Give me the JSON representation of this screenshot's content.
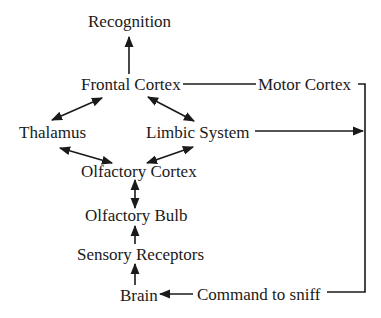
{
  "diagram": {
    "title": "",
    "nodes": [
      {
        "id": "recognition",
        "label": "Recognition"
      },
      {
        "id": "frontal_cortex",
        "label": "Frontal Cortex"
      },
      {
        "id": "motor_cortex",
        "label": "Motor Cortex"
      },
      {
        "id": "thalamus",
        "label": "Thalamus"
      },
      {
        "id": "limbic_system",
        "label": "Limbic System"
      },
      {
        "id": "olfactory_cortex",
        "label": "Olfactory Cortex"
      },
      {
        "id": "olfactory_bulb",
        "label": "Olfactory Bulb"
      },
      {
        "id": "sensory_receptors",
        "label": "Sensory Receptors"
      },
      {
        "id": "brain",
        "label": "Brain"
      },
      {
        "id": "command_to_sniff",
        "label": "Command to sniff"
      }
    ],
    "edges": [
      {
        "from": "frontal_cortex",
        "to": "recognition",
        "type": "arrow"
      },
      {
        "from": "frontal_cortex",
        "to": "thalamus",
        "type": "bidirectional"
      },
      {
        "from": "frontal_cortex",
        "to": "limbic_system",
        "type": "bidirectional"
      },
      {
        "from": "frontal_cortex",
        "to": "motor_cortex",
        "type": "line"
      },
      {
        "from": "thalamus",
        "to": "olfactory_cortex",
        "type": "bidirectional"
      },
      {
        "from": "limbic_system",
        "to": "olfactory_cortex",
        "type": "bidirectional"
      },
      {
        "from": "olfactory_cortex",
        "to": "olfactory_bulb",
        "type": "bidirectional"
      },
      {
        "from": "sensory_receptors",
        "to": "olfactory_bulb",
        "type": "arrow"
      },
      {
        "from": "brain",
        "to": "sensory_receptors",
        "type": "arrow"
      },
      {
        "from": "limbic_system",
        "to": "right_connector",
        "type": "arrow"
      },
      {
        "from": "motor_cortex",
        "to": "command_to_sniff",
        "type": "connector-line"
      },
      {
        "from": "command_to_sniff",
        "to": "brain",
        "type": "arrow"
      }
    ],
    "colors": {
      "line": "#1a1a1a",
      "text": "#1a1a1a",
      "background": "#ffffff"
    }
  }
}
